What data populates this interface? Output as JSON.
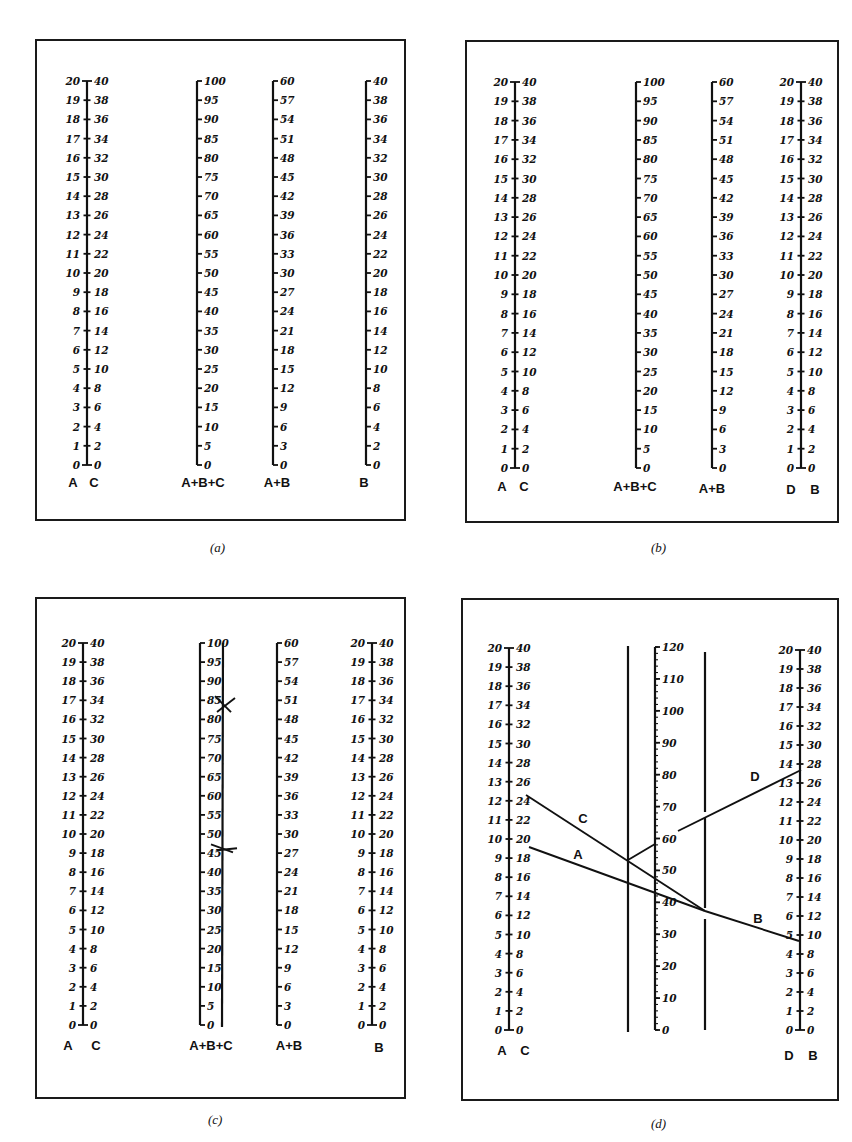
{
  "figure": {
    "panels": [
      {
        "id": "a",
        "caption": "(a)",
        "scales": [
          {
            "name": "A",
            "left_values": [
              0,
              1,
              2,
              3,
              4,
              5,
              6,
              7,
              8,
              9,
              10,
              11,
              12,
              13,
              14,
              15,
              16,
              17,
              18,
              19,
              20
            ],
            "right_name": "C",
            "right_values": [
              0,
              2,
              4,
              6,
              8,
              10,
              12,
              14,
              16,
              18,
              20,
              22,
              24,
              26,
              28,
              30,
              32,
              34,
              36,
              38,
              40
            ]
          },
          {
            "name": "A+B+C",
            "values": [
              0,
              5,
              10,
              15,
              20,
              25,
              30,
              35,
              40,
              45,
              50,
              55,
              60,
              65,
              70,
              75,
              80,
              85,
              90,
              95,
              100
            ]
          },
          {
            "name": "A+B",
            "values": [
              0,
              3,
              6,
              9,
              12,
              15,
              18,
              21,
              24,
              27,
              30,
              33,
              36,
              39,
              42,
              45,
              48,
              51,
              54,
              57,
              60
            ]
          },
          {
            "name": "B",
            "values": [
              0,
              2,
              4,
              6,
              8,
              10,
              12,
              14,
              16,
              18,
              20,
              22,
              24,
              26,
              28,
              30,
              32,
              34,
              36,
              38,
              40
            ]
          }
        ],
        "axis_labels": [
          "A",
          "C",
          "A+B+C",
          "A+B",
          "B"
        ]
      },
      {
        "id": "b",
        "caption": "(b)",
        "scales": [
          {
            "name": "A",
            "left_values": [
              0,
              1,
              2,
              3,
              4,
              5,
              6,
              7,
              8,
              9,
              10,
              11,
              12,
              13,
              14,
              15,
              16,
              17,
              18,
              19,
              20
            ],
            "right_name": "C",
            "right_values": [
              0,
              2,
              4,
              6,
              8,
              10,
              12,
              14,
              16,
              18,
              20,
              22,
              24,
              26,
              28,
              30,
              32,
              34,
              36,
              38,
              40
            ]
          },
          {
            "name": "A+B+C",
            "values": [
              0,
              5,
              10,
              15,
              20,
              25,
              30,
              35,
              40,
              45,
              50,
              55,
              60,
              65,
              70,
              75,
              80,
              85,
              90,
              95,
              100
            ]
          },
          {
            "name": "A+B",
            "values": [
              0,
              3,
              6,
              9,
              12,
              15,
              18,
              21,
              24,
              27,
              30,
              33,
              36,
              39,
              42,
              45,
              48,
              51,
              54,
              57,
              60
            ]
          },
          {
            "name": "D",
            "left_values": [
              0,
              1,
              2,
              3,
              4,
              5,
              6,
              7,
              8,
              9,
              10,
              11,
              12,
              13,
              14,
              15,
              16,
              17,
              18,
              19,
              20
            ],
            "right_name": "B",
            "right_values": [
              0,
              2,
              4,
              6,
              8,
              10,
              12,
              14,
              16,
              18,
              20,
              22,
              24,
              26,
              28,
              30,
              32,
              34,
              36,
              38,
              40
            ]
          }
        ],
        "axis_labels": [
          "A",
          "C",
          "A+B+C",
          "A+B",
          "D",
          "B"
        ]
      },
      {
        "id": "c",
        "caption": "(c)",
        "scales": [
          {
            "name": "A",
            "left_values": [
              0,
              1,
              2,
              3,
              4,
              5,
              6,
              7,
              8,
              9,
              10,
              11,
              12,
              13,
              14,
              15,
              16,
              17,
              18,
              19,
              20
            ],
            "right_name": "C",
            "right_values": [
              0,
              2,
              4,
              6,
              8,
              10,
              12,
              14,
              16,
              18,
              20,
              22,
              24,
              26,
              28,
              30,
              32,
              34,
              36,
              38,
              40
            ]
          },
          {
            "name": "A+B+C",
            "values": [
              0,
              5,
              10,
              15,
              20,
              25,
              30,
              35,
              40,
              45,
              50,
              55,
              60,
              65,
              70,
              75,
              80,
              85,
              90,
              95,
              100
            ]
          },
          {
            "name": "A+B",
            "values": [
              0,
              3,
              6,
              9,
              12,
              15,
              18,
              21,
              24,
              27,
              30,
              33,
              36,
              39,
              42,
              45,
              48,
              51,
              54,
              57,
              60
            ]
          },
          {
            "name": "B",
            "left_values": [
              0,
              1,
              2,
              3,
              4,
              5,
              6,
              7,
              8,
              9,
              10,
              11,
              12,
              13,
              14,
              15,
              16,
              17,
              18,
              19,
              20
            ],
            "right_values": [
              0,
              2,
              4,
              6,
              8,
              10,
              12,
              14,
              16,
              18,
              20,
              22,
              24,
              26,
              28,
              30,
              32,
              34,
              36,
              38,
              40
            ]
          }
        ],
        "marks": [
          {
            "type": "X",
            "on": "A+B+C",
            "value": 84
          },
          {
            "type": "X",
            "on": "A+B+C",
            "value": 46
          }
        ],
        "axis_labels": [
          "A",
          "C",
          "A+B+C",
          "A+B",
          "B"
        ]
      },
      {
        "id": "d",
        "caption": "(d)",
        "scales": [
          {
            "name": "A",
            "left_values": [
              0,
              1,
              2,
              3,
              4,
              5,
              6,
              7,
              8,
              9,
              10,
              11,
              12,
              13,
              14,
              15,
              16,
              17,
              18,
              19,
              20
            ],
            "right_name": "C",
            "right_values": [
              0,
              2,
              4,
              6,
              8,
              10,
              12,
              14,
              16,
              18,
              20,
              22,
              24,
              26,
              28,
              30,
              32,
              34,
              36,
              38,
              40
            ]
          },
          {
            "name": "A+B+C+D",
            "values": [
              0,
              10,
              20,
              30,
              40,
              50,
              60,
              70,
              80,
              90,
              100,
              110,
              120
            ],
            "minor_step": 2
          },
          {
            "name": "D",
            "left_values": [
              0,
              1,
              2,
              3,
              4,
              5,
              6,
              7,
              8,
              9,
              10,
              11,
              12,
              13,
              14,
              15,
              16,
              17,
              18,
              19,
              20
            ],
            "right_name": "B",
            "right_values": [
              0,
              2,
              4,
              6,
              8,
              10,
              12,
              14,
              16,
              18,
              20,
              22,
              24,
              26,
              28,
              30,
              32,
              34,
              36,
              38,
              40
            ]
          }
        ],
        "construction_lines": [
          {
            "label": "A",
            "from": "A=9.6 (C=19.2)",
            "to": "right pivot line"
          },
          {
            "label": "B",
            "from": "right pivot line",
            "to": "B=10 (D=5)"
          },
          {
            "label": "C",
            "from": "C=25",
            "to": "right pivot line"
          },
          {
            "label": "D",
            "from": "left pivot (~60 on middle scale)",
            "to": "D=14 (B=28)"
          }
        ],
        "axis_labels": [
          "A",
          "C",
          "D",
          "B"
        ]
      }
    ]
  }
}
